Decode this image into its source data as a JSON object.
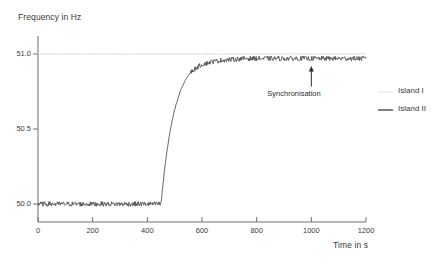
{
  "chart_data": {
    "type": "line",
    "title": "",
    "xlabel": "Time in s",
    "ylabel": "Frequency in Hz",
    "xlim": [
      0,
      1200
    ],
    "ylim": [
      49.88,
      51.12
    ],
    "xticks": [
      0,
      200,
      400,
      600,
      800,
      1000,
      1200
    ],
    "xtick_labels": [
      "0",
      "200",
      "400",
      "600",
      "800",
      "1000",
      "1200"
    ],
    "yticks": [
      50.0,
      50.5,
      51.0
    ],
    "ytick_labels": [
      "50.0",
      "50.5",
      "51.0"
    ],
    "grid": false,
    "legend_position": "right",
    "series": [
      {
        "name": "Island I",
        "color": "#e8e8e8",
        "description": "Constant reference frequency at 51.0 Hz across the full time range",
        "x": [
          0,
          100,
          200,
          300,
          400,
          500,
          600,
          700,
          800,
          900,
          1000,
          1100,
          1200
        ],
        "values": [
          51.0,
          51.0,
          51.0,
          51.0,
          51.0,
          51.0,
          51.0,
          51.0,
          51.0,
          51.0,
          51.0,
          51.0,
          51.0
        ]
      },
      {
        "name": "Island II",
        "color": "#4a4a4a",
        "description": "Noisy signal held near 50.0 Hz until t=450 s, then ramps up and settles near 50.97 Hz",
        "x": [
          0,
          50,
          100,
          150,
          200,
          250,
          300,
          350,
          400,
          440,
          450,
          460,
          470,
          480,
          490,
          500,
          520,
          540,
          560,
          580,
          600,
          640,
          680,
          720,
          760,
          800,
          850,
          900,
          950,
          1000,
          1050,
          1100,
          1150,
          1200
        ],
        "values": [
          50.0,
          50.0,
          50.0,
          50.0,
          50.0,
          50.0,
          50.0,
          50.0,
          50.0,
          50.0,
          50.0,
          50.18,
          50.33,
          50.45,
          50.55,
          50.63,
          50.75,
          50.83,
          50.88,
          50.91,
          50.93,
          50.95,
          50.96,
          50.965,
          50.97,
          50.97,
          50.97,
          50.97,
          50.97,
          50.97,
          50.97,
          50.97,
          50.97,
          50.97
        ]
      }
    ],
    "annotations": [
      {
        "text": "Synchronisation",
        "x": 1000,
        "y": 50.97,
        "marker": "up-arrow"
      }
    ]
  }
}
